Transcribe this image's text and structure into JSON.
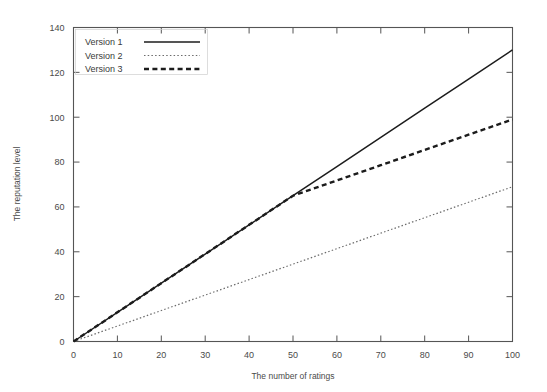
{
  "chart_data": {
    "type": "line",
    "title": "",
    "xlabel": "The number of ratings",
    "ylabel": "The reputation level",
    "xlim": [
      0,
      100
    ],
    "ylim": [
      0,
      140
    ],
    "xticks": [
      0,
      10,
      20,
      30,
      40,
      50,
      60,
      70,
      80,
      90,
      100
    ],
    "yticks": [
      0,
      20,
      40,
      60,
      80,
      100,
      120,
      140
    ],
    "grid": false,
    "legend_position": "top-left",
    "series": [
      {
        "name": "Version 1",
        "style": "solid",
        "color": "#1c1c1c",
        "x": [
          0,
          10,
          20,
          30,
          40,
          50,
          60,
          70,
          80,
          90,
          100
        ],
        "values": [
          0,
          13,
          26,
          39,
          52,
          65,
          78,
          91,
          104,
          117,
          130
        ]
      },
      {
        "name": "Version 2",
        "style": "dotted",
        "color": "#6b6b6b",
        "x": [
          0,
          10,
          20,
          30,
          40,
          50,
          60,
          70,
          80,
          90,
          100
        ],
        "values": [
          0,
          6.9,
          13.8,
          20.7,
          27.6,
          34.5,
          41.4,
          48.3,
          55.2,
          62.1,
          69
        ]
      },
      {
        "name": "Version 3",
        "style": "dashed",
        "color": "#1c1c1c",
        "x": [
          0,
          10,
          20,
          30,
          40,
          50,
          60,
          70,
          80,
          90,
          100
        ],
        "values": [
          0,
          13,
          26,
          39,
          52,
          65,
          71.8,
          78.6,
          85.4,
          92.2,
          99
        ]
      }
    ]
  },
  "axes": {
    "x_title": "The number of ratings",
    "y_title": "The reputation level",
    "x_tick_labels": [
      "0",
      "10",
      "20",
      "30",
      "40",
      "50",
      "60",
      "70",
      "80",
      "90",
      "100"
    ],
    "y_tick_labels": [
      "0",
      "20",
      "40",
      "60",
      "80",
      "100",
      "120",
      "140"
    ]
  },
  "legend": {
    "items": [
      {
        "label": "Version 1",
        "style": "solid"
      },
      {
        "label": "Version 2",
        "style": "dotted"
      },
      {
        "label": "Version 3",
        "style": "dashed"
      }
    ]
  }
}
